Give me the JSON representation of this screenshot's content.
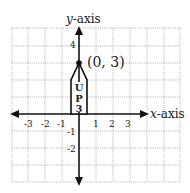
{
  "diagram": {
    "type": "coordinate-plane",
    "x_axis_label": {
      "var": "x",
      "rest": "-axis"
    },
    "y_axis_label": {
      "var": "y",
      "rest": "-axis"
    },
    "x_ticks": [
      {
        "value": -3,
        "label": "-3"
      },
      {
        "value": -2,
        "label": "-2"
      },
      {
        "value": -1,
        "label": "-1"
      },
      {
        "value": 1,
        "label": "1"
      },
      {
        "value": 2,
        "label": "2"
      },
      {
        "value": 3,
        "label": "3"
      }
    ],
    "y_ticks": [
      {
        "value": 4,
        "label": "4"
      },
      {
        "value": -1,
        "label": "-1"
      },
      {
        "value": -2,
        "label": "-2"
      }
    ],
    "point": {
      "x": 0,
      "y": 3,
      "label": "(0, 3)"
    },
    "shape": {
      "kind": "pencil-arrow",
      "vertices": [
        [
          -0.5,
          0
        ],
        [
          -0.5,
          2
        ],
        [
          0,
          3
        ],
        [
          0.5,
          2
        ],
        [
          0.5,
          0
        ]
      ],
      "text_lines": [
        "U",
        "P",
        "3"
      ]
    },
    "colors": {
      "grid": "#888888",
      "axis": "#111111",
      "background": "#ffffff"
    }
  }
}
